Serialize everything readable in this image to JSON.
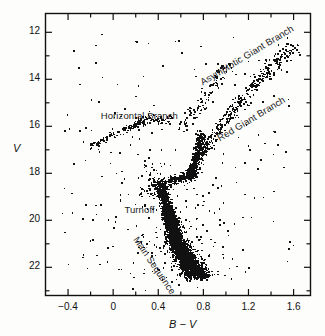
{
  "figure": {
    "background_color": "#fdfdfc",
    "ink_color": "#111111"
  },
  "chart_data": {
    "type": "scatter",
    "title": "",
    "subtitle": "",
    "xlabel": "B − V",
    "ylabel": "V",
    "xlim": [
      -0.6,
      1.75
    ],
    "ylim_display_top": 11.2,
    "ylim_display_bottom": 23.2,
    "y_axis_inverted": true,
    "grid": false,
    "legend": "none",
    "x_ticks_major": [
      -0.4,
      0,
      0.4,
      0.8,
      1.2,
      1.6
    ],
    "x_tick_labels": [
      "−0.4",
      "0",
      "0.4",
      "0.8",
      "1.2",
      "1.6"
    ],
    "x_ticks_minor": [
      -0.2,
      0.2,
      0.6,
      1.0,
      1.4
    ],
    "y_ticks_major": [
      12,
      14,
      16,
      18,
      20,
      22
    ],
    "y_tick_labels": [
      "12",
      "14",
      "16",
      "18",
      "20",
      "22"
    ],
    "y_ticks_minor": [
      13,
      15,
      17,
      19,
      21,
      23
    ],
    "marker": "square-dot",
    "marker_color": "#111111",
    "point_count_approx": 4200,
    "annotations": [
      {
        "key": "asymptotic_giant_branch",
        "text": "Asymptotic Giant Branch",
        "x_data": 0.78,
        "y_data": 13.9,
        "rotation_deg": -31
      },
      {
        "key": "red_giant_branch",
        "text": "Red Giant Branch",
        "x_data": 0.93,
        "y_data": 16.3,
        "rotation_deg": -31
      },
      {
        "key": "horizontal_branch",
        "text": "Horizontal Branch",
        "x_data": -0.11,
        "y_data": 15.3,
        "rotation_deg": 0
      },
      {
        "key": "turnoff",
        "text": "Turnoff",
        "x_data": 0.1,
        "y_data": 19.3,
        "rotation_deg": 0
      },
      {
        "key": "main_sequence",
        "text": "Main Sequence",
        "x_data": 0.2,
        "y_data": 20.5,
        "rotation_deg": 56
      }
    ],
    "populations": [
      {
        "name": "Main Sequence",
        "description": "Dense band from turnoff at (B-V ≈ 0.42, V ≈ 18.9) descending to (B-V ≈ 0.75, V ≈ 22.3)",
        "x_range": [
          0.35,
          0.85
        ],
        "y_range": [
          18.5,
          22.5
        ]
      },
      {
        "name": "Turnoff",
        "description": "Knee of the main sequence near (0.42, 19.0)",
        "x_range": [
          0.38,
          0.52
        ],
        "y_range": [
          18.4,
          19.6
        ]
      },
      {
        "name": "Subgiant Branch",
        "description": "Short bridge from turnoff toward the red giant branch base",
        "x_range": [
          0.45,
          0.72
        ],
        "y_range": [
          17.8,
          18.7
        ]
      },
      {
        "name": "Red Giant Branch",
        "description": "Narrow rising sequence from (0.70, 18.2) up to (1.55, 12.7)",
        "x_range": [
          0.68,
          1.58
        ],
        "y_range": [
          12.6,
          18.3
        ]
      },
      {
        "name": "Asymptotic Giant Branch",
        "description": "Sparse sequence bluewards of and parallel to the RGB, (0.62, 16.0) to (1.05, 13.5)",
        "x_range": [
          0.6,
          1.1
        ],
        "y_range": [
          13.2,
          16.2
        ]
      },
      {
        "name": "Horizontal Branch",
        "description": "Nearly horizontal strip from (-0.20, 17.0) through (0.05, 16.4) to (0.30, 15.8)",
        "x_range": [
          -0.22,
          0.33
        ],
        "y_range": [
          15.6,
          17.1
        ]
      },
      {
        "name": "Field / Blue Stragglers & Outliers",
        "description": "Sparse scattered points across the diagram",
        "x_range": [
          -0.35,
          1.65
        ],
        "y_range": [
          12.5,
          22.8
        ]
      }
    ]
  }
}
